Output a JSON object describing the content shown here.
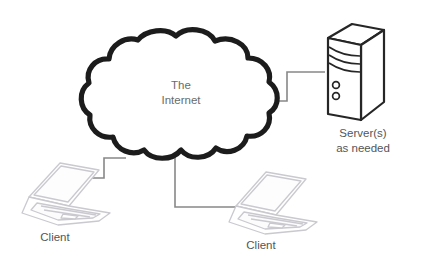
{
  "diagram": {
    "type": "network-topology",
    "title_text_visible": false,
    "background_color": "#ffffff",
    "cloud": {
      "name": "internet-cloud",
      "label_line1": "The",
      "label_line2": "Internet",
      "outline_color": "#1a1a1a",
      "fill_color": "#ffffff",
      "text_color": "#6b6b6b"
    },
    "server": {
      "name": "server-node",
      "label_line1": "Server(s)",
      "label_line2": "as needed",
      "outline_color": "#262626",
      "fill_color": "#ffffff",
      "text_color": "#555555",
      "indicator_count": 2,
      "vent_slot_count": 3
    },
    "clients": [
      {
        "name": "client-laptop-left",
        "label": "Client",
        "outline_color": "#c9c9cf",
        "text_color": "#555555"
      },
      {
        "name": "client-laptop-right",
        "label": "Client",
        "outline_color": "#c9c9cf",
        "text_color": "#555555"
      }
    ],
    "connections": [
      {
        "name": "link-cloud-to-server",
        "from": "internet-cloud",
        "to": "server-node",
        "color": "#808080"
      },
      {
        "name": "link-client-left-to-cloud",
        "from": "client-laptop-left",
        "to": "internet-cloud",
        "color": "#808080"
      },
      {
        "name": "link-client-right-to-cloud",
        "from": "client-laptop-right",
        "to": "internet-cloud",
        "color": "#808080"
      }
    ]
  }
}
